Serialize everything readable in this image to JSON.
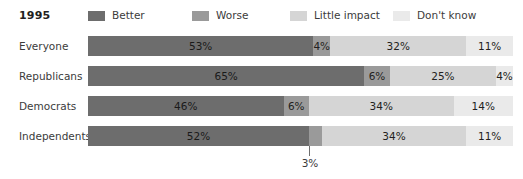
{
  "header": {
    "year": "1995"
  },
  "legend": [
    {
      "label": "Better",
      "key": "better",
      "color": "#6d6d6d"
    },
    {
      "label": "Worse",
      "key": "worse",
      "color": "#9a9a9a"
    },
    {
      "label": "Little impact",
      "key": "little",
      "color": "#d5d5d5"
    },
    {
      "label": "Don't know",
      "key": "dontknow",
      "color": "#eaeaea"
    }
  ],
  "callout": {
    "label": "3%",
    "series": "Worse",
    "category": "Independents"
  },
  "rows": [
    {
      "label": "Everyone",
      "segments": [
        {
          "label": "53%",
          "value": 53
        },
        {
          "label": "4%",
          "value": 4
        },
        {
          "label": "32%",
          "value": 32
        },
        {
          "label": "11%",
          "value": 11
        }
      ]
    },
    {
      "label": "Republicans",
      "segments": [
        {
          "label": "65%",
          "value": 65
        },
        {
          "label": "6%",
          "value": 6
        },
        {
          "label": "25%",
          "value": 25
        },
        {
          "label": "4%",
          "value": 4
        }
      ]
    },
    {
      "label": "Democrats",
      "segments": [
        {
          "label": "46%",
          "value": 46
        },
        {
          "label": "6%",
          "value": 6
        },
        {
          "label": "34%",
          "value": 34
        },
        {
          "label": "14%",
          "value": 14
        }
      ]
    },
    {
      "label": "Independents",
      "segments": [
        {
          "label": "52%",
          "value": 52
        },
        {
          "label": "",
          "value": 3
        },
        {
          "label": "34%",
          "value": 34
        },
        {
          "label": "11%",
          "value": 11
        }
      ]
    }
  ],
  "chart_data": {
    "type": "bar",
    "title": "1995",
    "xlabel": "",
    "ylabel": "",
    "orientation": "horizontal",
    "stacked": true,
    "normalized": true,
    "xlim": [
      0,
      100
    ],
    "grid": false,
    "legend_position": "top",
    "categories": [
      "Everyone",
      "Republicans",
      "Democrats",
      "Independents"
    ],
    "series": [
      {
        "name": "Better",
        "values": [
          53,
          65,
          46,
          52
        ]
      },
      {
        "name": "Worse",
        "values": [
          4,
          6,
          6,
          3
        ]
      },
      {
        "name": "Little impact",
        "values": [
          32,
          25,
          34,
          34
        ]
      },
      {
        "name": "Don't know",
        "values": [
          11,
          4,
          14,
          11
        ]
      }
    ],
    "annotations": [
      {
        "text": "3%",
        "category": "Independents",
        "series": "Worse",
        "placement": "below-bar-with-leader-line"
      }
    ]
  }
}
